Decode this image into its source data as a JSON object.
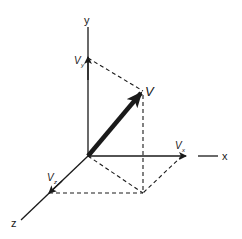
{
  "diagram": {
    "type": "3d-vector-components",
    "axes": {
      "x_label": "x",
      "y_label": "y",
      "z_label": "z"
    },
    "vector": {
      "label": "V",
      "components": {
        "x": {
          "label": "V",
          "subscript": "x"
        },
        "y": {
          "label": "V",
          "subscript": "y"
        },
        "z": {
          "label": "V",
          "subscript": "z"
        }
      }
    },
    "colors": {
      "line": "#1a1a1a",
      "background": "#ffffff"
    }
  }
}
